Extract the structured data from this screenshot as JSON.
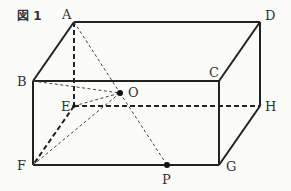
{
  "figure": {
    "title": "図 1",
    "labels": {
      "A": "A",
      "B": "B",
      "C": "C",
      "D": "D",
      "E": "E",
      "F": "F",
      "G": "G",
      "H": "H",
      "O": "O",
      "P": "P"
    }
  },
  "points": {
    "A": [
      74,
      22
    ],
    "D": [
      260,
      22
    ],
    "B": [
      33,
      81
    ],
    "C": [
      219,
      81
    ],
    "E": [
      74,
      106
    ],
    "H": [
      260,
      106
    ],
    "F": [
      33,
      165
    ],
    "G": [
      219,
      165
    ],
    "O": [
      120,
      93
    ],
    "P": [
      167,
      165
    ]
  }
}
